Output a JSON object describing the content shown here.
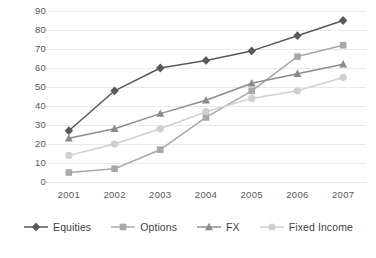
{
  "chart_data": {
    "type": "line",
    "title": "",
    "xlabel": "",
    "ylabel": "",
    "categories": [
      "2001",
      "2002",
      "2003",
      "2004",
      "2005",
      "2006",
      "2007"
    ],
    "x": [
      2001,
      2002,
      2003,
      2004,
      2005,
      2006,
      2007
    ],
    "ylim": [
      0,
      90
    ],
    "ytick_step": 10,
    "yticks": [
      "90",
      "80",
      "70",
      "60",
      "50",
      "40",
      "30",
      "20",
      "10",
      "0"
    ],
    "grid": "horizontal",
    "legend_position": "bottom",
    "series": [
      {
        "name": "Equities",
        "marker": "diamond",
        "color": "#595959",
        "values": [
          27,
          48,
          60,
          64,
          69,
          77,
          85
        ]
      },
      {
        "name": "Options",
        "marker": "square",
        "color": "#a8a8a8",
        "values": [
          5,
          7,
          17,
          34,
          48,
          66,
          72
        ]
      },
      {
        "name": "FX",
        "marker": "triangle",
        "color": "#8c8c8c",
        "values": [
          23,
          28,
          36,
          43,
          52,
          57,
          62
        ]
      },
      {
        "name": "Fixed Income",
        "marker": "circle",
        "color": "#cfcfcf",
        "values": [
          14,
          20,
          28,
          37,
          44,
          48,
          55
        ]
      }
    ]
  },
  "axes": {
    "gridline_color": "#e9e9e9",
    "tick_label_color": "#585858"
  },
  "legend": {
    "items": [
      {
        "label": "Equities"
      },
      {
        "label": "Options"
      },
      {
        "label": "FX"
      },
      {
        "label": "Fixed Income"
      }
    ]
  }
}
